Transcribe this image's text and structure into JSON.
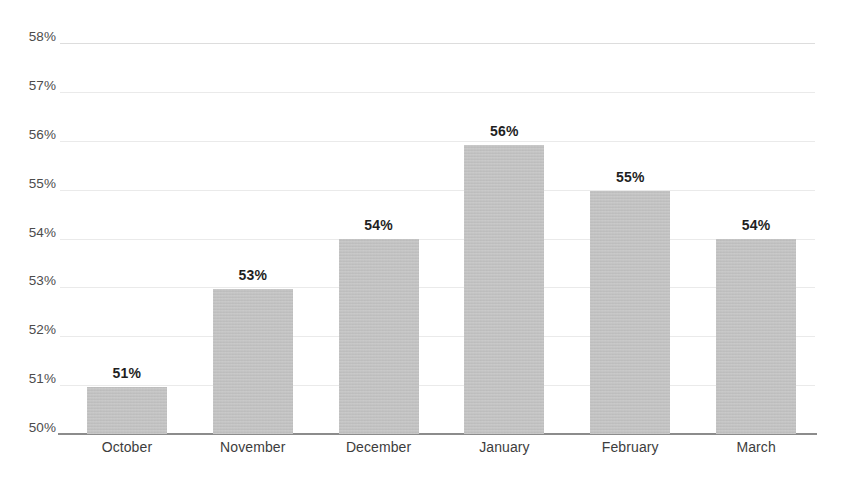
{
  "chart_data": {
    "type": "bar",
    "title": "",
    "subtitle": "",
    "xlabel": "",
    "ylabel": "",
    "categories": [
      "October",
      "November",
      "December",
      "January",
      "February",
      "March"
    ],
    "values": [
      50.96,
      52.96,
      53.98,
      55.92,
      54.98,
      53.98
    ],
    "data_labels": [
      "51%",
      "53%",
      "54%",
      "56%",
      "55%",
      "54%"
    ],
    "ylim": [
      50,
      58
    ],
    "ytick_values": [
      58,
      57,
      56,
      55,
      54,
      53,
      52,
      51,
      50
    ],
    "ytick_labels": [
      "58%",
      "57%",
      "56%",
      "55%",
      "54%",
      "53%",
      "52%",
      "51%",
      "50%"
    ],
    "grid": true,
    "legend": false,
    "legend_position": "none",
    "bar_color": "#bfbfbf",
    "gridline_color": "#d7d7d7",
    "axis_color": "#8c8c8c",
    "label_color": "#1f1f1f",
    "background_color": "#ffffff"
  },
  "axis": {
    "y_ticks": [
      {
        "label": "58%",
        "value": 58
      },
      {
        "label": "57%",
        "value": 57
      },
      {
        "label": "56%",
        "value": 56
      },
      {
        "label": "55%",
        "value": 55
      },
      {
        "label": "54%",
        "value": 54
      },
      {
        "label": "53%",
        "value": 53
      },
      {
        "label": "52%",
        "value": 52
      },
      {
        "label": "51%",
        "value": 51
      },
      {
        "label": "50%",
        "value": 50
      }
    ]
  },
  "bars": [
    {
      "category": "October",
      "value": 50.96,
      "label": "51%"
    },
    {
      "category": "November",
      "value": 52.96,
      "label": "53%"
    },
    {
      "category": "December",
      "value": 53.98,
      "label": "54%"
    },
    {
      "category": "January",
      "value": 55.92,
      "label": "56%"
    },
    {
      "category": "February",
      "value": 54.98,
      "label": "55%"
    },
    {
      "category": "March",
      "value": 53.98,
      "label": "54%"
    }
  ]
}
